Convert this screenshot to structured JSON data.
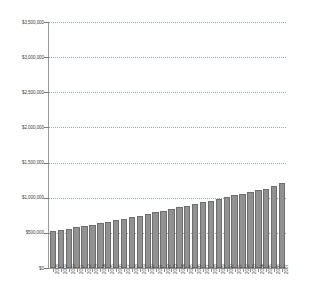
{
  "chart_data": {
    "type": "bar",
    "title": "",
    "subtitle": "",
    "xlabel": "",
    "ylabel": "",
    "ylim": [
      0,
      3500000
    ],
    "grid": true,
    "legend": null,
    "y_ticks": [
      0,
      500000,
      1000000,
      1500000,
      2000000,
      2500000,
      3000000,
      3500000
    ],
    "y_tick_labels": [
      "$0",
      "$500,000",
      "$1,000,000",
      "$1,500,000",
      "$2,000,000",
      "$2,500,000",
      "$3,000,000",
      "$3,500,000"
    ],
    "categories": [
      "2008",
      "2009",
      "2010",
      "2011",
      "2012",
      "2013",
      "2014",
      "2015",
      "2016",
      "2017",
      "2018",
      "2019",
      "2020",
      "2021",
      "2022",
      "2023",
      "2024",
      "2025",
      "2026",
      "2027",
      "2028",
      "2029",
      "2030",
      "2031",
      "2032",
      "2033",
      "2034",
      "2035",
      "2036",
      "2037"
    ],
    "values": [
      530000,
      545000,
      560000,
      578000,
      596000,
      616000,
      635000,
      655000,
      678000,
      700000,
      722000,
      745000,
      768000,
      792000,
      816000,
      840000,
      864000,
      888000,
      912000,
      936000,
      960000,
      984000,
      1008000,
      1032000,
      1056000,
      1080000,
      1104000,
      1130000,
      1170000,
      1205000
    ],
    "bar_color": "#919191",
    "bar_border_color": "#6e6e6e",
    "gridline_color": "#9aa7c4",
    "axis_color": "#9a9a9a",
    "text_color": "#3f3f3f"
  }
}
